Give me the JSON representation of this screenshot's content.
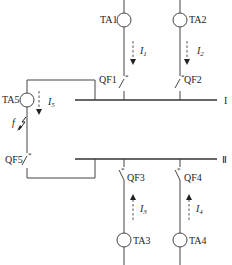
{
  "diagram": {
    "buses": [
      {
        "id": "bus-1",
        "label": "I"
      },
      {
        "id": "bus-2",
        "label": "Ⅱ"
      }
    ],
    "current_transformers": [
      {
        "id": "TA1",
        "label": "TA1"
      },
      {
        "id": "TA2",
        "label": "TA2"
      },
      {
        "id": "TA3",
        "label": "TA3"
      },
      {
        "id": "TA4",
        "label": "TA4"
      },
      {
        "id": "TA5",
        "label": "TA5"
      }
    ],
    "breakers": [
      {
        "id": "QF1",
        "label": "QF1"
      },
      {
        "id": "QF2",
        "label": "QF2"
      },
      {
        "id": "QF3",
        "label": "QF3"
      },
      {
        "id": "QF4",
        "label": "QF4"
      },
      {
        "id": "QF5",
        "label": "QF5"
      }
    ],
    "currents": [
      {
        "id": "I1",
        "symbol": "I",
        "sub": "1",
        "direction": "down"
      },
      {
        "id": "I2",
        "symbol": "I",
        "sub": "2",
        "direction": "down"
      },
      {
        "id": "I3",
        "symbol": "I",
        "sub": "3",
        "direction": "up"
      },
      {
        "id": "I4",
        "symbol": "I",
        "sub": "4",
        "direction": "up"
      },
      {
        "id": "I5",
        "symbol": "I",
        "sub": "5",
        "direction": "down"
      }
    ],
    "fault": {
      "label": "f"
    },
    "star_mark": "*"
  }
}
